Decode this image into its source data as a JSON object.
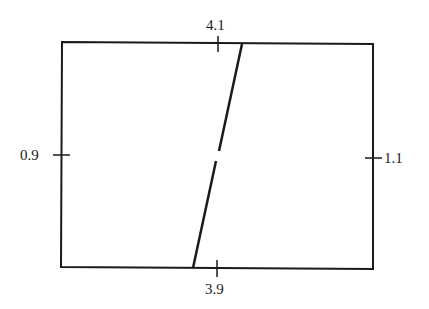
{
  "diagram": {
    "type": "rectangle-with-slanted-line",
    "labels": {
      "top": "4.1",
      "bottom": "3.9",
      "left": "0.9",
      "right": "1.1"
    },
    "colors": {
      "stroke": "#1a1a1a",
      "background": "#ffffff"
    }
  }
}
